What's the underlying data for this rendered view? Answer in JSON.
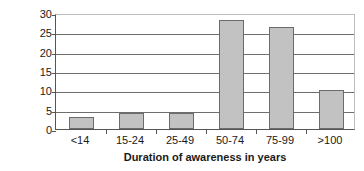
{
  "chart_data": {
    "type": "bar",
    "title": "",
    "subtitle": "",
    "xlabel": "Duration of awareness in years",
    "ylabel": "Percent",
    "categories": [
      "<14",
      "15-24",
      "25-49",
      "50-74",
      "75-99",
      ">100"
    ],
    "values": [
      3.0,
      4.2,
      4.2,
      28.2,
      26.3,
      10.2
    ],
    "ylim": [
      0,
      30
    ],
    "ytick_step": 5,
    "ytick_labels": [
      "30",
      "25",
      "20",
      "15",
      "10",
      "5",
      "0"
    ],
    "ytick_values": [
      30,
      25,
      20,
      15,
      10,
      5,
      0
    ],
    "grid": "horizontal",
    "legend": "none",
    "bar_fill_color": "#c2c2c2",
    "bar_border_color": "#6b6b6b",
    "gridline_color": "#6e6e6e",
    "axis_color": "#555555",
    "background_color": "#ffffff",
    "annotations": []
  }
}
